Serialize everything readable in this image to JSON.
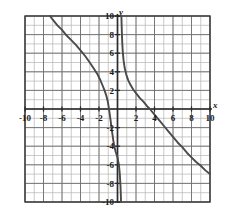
{
  "figure": {
    "name": "coordinate-plane-graph",
    "background_color": "#ffffff",
    "plot_area": {
      "left": 25,
      "top": 16,
      "right": 210,
      "bottom": 202
    }
  },
  "axes": {
    "x_axis_label": "x",
    "y_axis_label": "y",
    "x_label_color": "#1a1a1a",
    "y_label_color": "#1a1a1a",
    "axis_color": "#2b2b2b",
    "x_ticks": [
      -10,
      -8,
      -6,
      -4,
      -2,
      2,
      4,
      6,
      8,
      10
    ],
    "y_ticks": [
      10,
      8,
      6,
      4,
      2,
      -2,
      -4,
      -6,
      -8,
      -10
    ],
    "x_tick_labels": [
      "-10",
      "-8",
      "-6",
      "-4",
      "-2",
      "2",
      "4",
      "6",
      "8",
      "10"
    ],
    "y_tick_labels": [
      "10",
      "8",
      "6",
      "4",
      "2",
      "-2",
      "-4",
      "-6",
      "-8",
      "-10"
    ],
    "xlim": [
      -10,
      10
    ],
    "ylim": [
      -10,
      10
    ]
  },
  "grid": {
    "minor_step": 1,
    "major_step": 2,
    "minor_color": "#b4b4b4",
    "major_color": "#6e6e6e",
    "visible": true
  },
  "chart_data": {
    "type": "line",
    "title": "",
    "xlabel": "x",
    "ylabel": "y",
    "xlim": [
      -10,
      10
    ],
    "ylim": [
      -10,
      10
    ],
    "grid": true,
    "legend": "none",
    "curve_color": "#4a4a4a",
    "vertical_asymptote_x": 0.4,
    "x_intercept": 3.5,
    "series": [
      {
        "name": "left-branch",
        "points": [
          [
            -7.3,
            10.0
          ],
          [
            -7.0,
            9.6
          ],
          [
            -6.5,
            9.0
          ],
          [
            -6.0,
            8.5
          ],
          [
            -5.5,
            7.9
          ],
          [
            -5.0,
            7.4
          ],
          [
            -4.5,
            6.9
          ],
          [
            -4.0,
            6.3
          ],
          [
            -3.5,
            5.7
          ],
          [
            -3.0,
            5.0
          ],
          [
            -2.6,
            4.4
          ],
          [
            -2.2,
            3.8
          ],
          [
            -1.9,
            3.2
          ],
          [
            -1.6,
            2.5
          ],
          [
            -1.4,
            2.0
          ],
          [
            -1.2,
            1.4
          ],
          [
            -1.05,
            0.8
          ],
          [
            -0.95,
            0.2
          ],
          [
            -0.85,
            -0.5
          ],
          [
            -0.75,
            -1.2
          ],
          [
            -0.65,
            -2.0
          ],
          [
            -0.55,
            -2.7
          ],
          [
            -0.45,
            -3.4
          ],
          [
            -0.35,
            -4.0
          ],
          [
            -0.2,
            -4.6
          ],
          [
            0.0,
            -5.2
          ],
          [
            0.15,
            -6.0
          ],
          [
            0.25,
            -7.0
          ],
          [
            0.32,
            -8.2
          ],
          [
            0.36,
            -9.2
          ],
          [
            0.38,
            -10.0
          ]
        ]
      },
      {
        "name": "right-branch",
        "points": [
          [
            0.42,
            10.0
          ],
          [
            0.45,
            9.0
          ],
          [
            0.48,
            8.0
          ],
          [
            0.52,
            7.0
          ],
          [
            0.58,
            6.0
          ],
          [
            0.66,
            5.2
          ],
          [
            0.78,
            4.4
          ],
          [
            0.95,
            3.7
          ],
          [
            1.15,
            3.1
          ],
          [
            1.4,
            2.6
          ],
          [
            1.7,
            2.1
          ],
          [
            2.0,
            1.7
          ],
          [
            2.4,
            1.2
          ],
          [
            2.8,
            0.8
          ],
          [
            3.2,
            0.3
          ],
          [
            3.5,
            0.0
          ],
          [
            4.0,
            -0.6
          ],
          [
            4.5,
            -1.2
          ],
          [
            5.0,
            -1.8
          ],
          [
            5.5,
            -2.4
          ],
          [
            6.0,
            -3.0
          ],
          [
            6.5,
            -3.6
          ],
          [
            7.0,
            -4.1
          ],
          [
            7.5,
            -4.7
          ],
          [
            8.0,
            -5.2
          ],
          [
            8.5,
            -5.7
          ],
          [
            9.0,
            -6.1
          ],
          [
            9.5,
            -6.6
          ],
          [
            10.0,
            -7.0
          ]
        ]
      }
    ]
  }
}
